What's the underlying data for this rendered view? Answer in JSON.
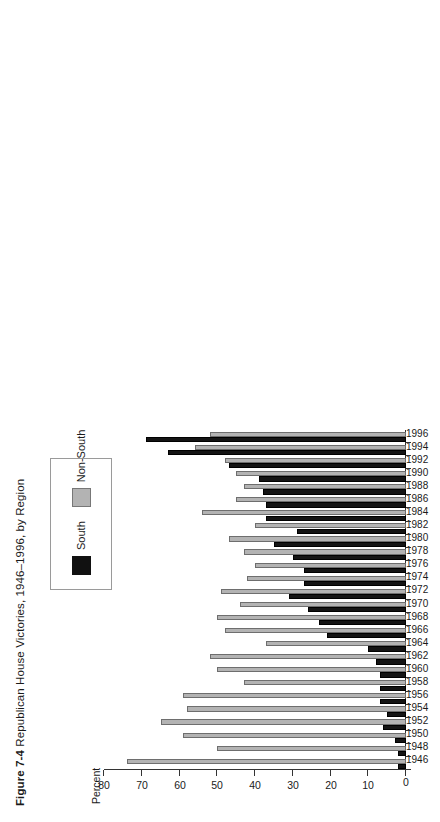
{
  "figure": {
    "number": "Figure 7-4",
    "title": "Republican House Victories, 1946–1996, by Region"
  },
  "legend": {
    "position": "top-left-inset",
    "items": [
      {
        "label": "South",
        "color": "#141414",
        "name": "legend-swatch-south"
      },
      {
        "label": "Non-South",
        "color": "#b3b3b3",
        "name": "legend-swatch-non-south"
      }
    ]
  },
  "axis": {
    "y_label": "Percent",
    "y_ticks": [
      "80",
      "70",
      "60",
      "50",
      "40",
      "30",
      "20",
      "10",
      "0"
    ]
  },
  "chart_data": {
    "type": "bar",
    "orientation": "horizontal-scanned-rotated",
    "title": "Figure 7-4 Republican House Victories, 1946–1996, by Region",
    "xlabel": "",
    "ylabel": "Percent",
    "ylim": [
      0,
      80
    ],
    "grid": false,
    "legend_position": "upper-left",
    "categories": [
      "1946",
      "1948",
      "1950",
      "1952",
      "1954",
      "1956",
      "1958",
      "1960",
      "1962",
      "1964",
      "1966",
      "1968",
      "1970",
      "1972",
      "1974",
      "1976",
      "1978",
      "1980",
      "1982",
      "1984",
      "1986",
      "1988",
      "1990",
      "1992",
      "1994",
      "1996"
    ],
    "series": [
      {
        "name": "South",
        "color": "#141414",
        "values": [
          2,
          2,
          3,
          6,
          5,
          7,
          7,
          7,
          8,
          10,
          21,
          23,
          26,
          31,
          27,
          27,
          30,
          35,
          29,
          37,
          37,
          38,
          39,
          47,
          63,
          69
        ]
      },
      {
        "name": "Non-South",
        "color": "#b3b3b3",
        "values": [
          74,
          50,
          59,
          65,
          58,
          59,
          43,
          50,
          52,
          37,
          48,
          50,
          44,
          49,
          42,
          40,
          43,
          47,
          40,
          54,
          45,
          43,
          45,
          48,
          56,
          52
        ]
      }
    ]
  }
}
